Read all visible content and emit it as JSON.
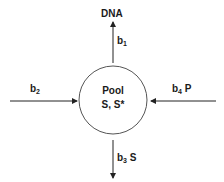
{
  "diagram": {
    "pool": {
      "title": "Pool",
      "contents": "S, S*"
    },
    "top": {
      "target": "DNA",
      "rate_base": "b",
      "rate_sub": "1",
      "suffix": ""
    },
    "left": {
      "rate_base": "b",
      "rate_sub": "2",
      "suffix": ""
    },
    "right": {
      "rate_base": "b",
      "rate_sub": "4",
      "suffix": "P"
    },
    "bottom": {
      "rate_base": "b",
      "rate_sub": "3",
      "suffix": "S"
    }
  },
  "colors": {
    "line": "#222222",
    "circle": "#555555",
    "text": "#1a1a1a",
    "background": "#ffffff"
  }
}
